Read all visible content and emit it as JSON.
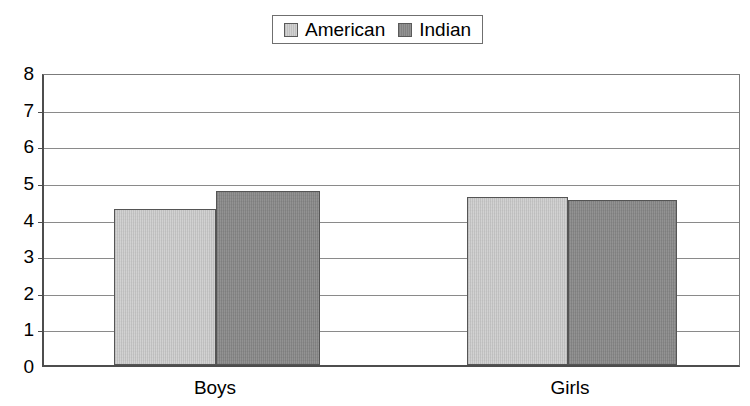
{
  "chart_data": {
    "type": "bar",
    "title": "",
    "subtitle": "",
    "xlabel": "",
    "ylabel": "",
    "categories": [
      "Boys",
      "Girls"
    ],
    "series": [
      {
        "name": "American",
        "values": [
          4.25,
          4.6
        ],
        "color": "#d2d2d2"
      },
      {
        "name": "Indian",
        "values": [
          4.75,
          4.5
        ],
        "color": "#939393"
      }
    ],
    "ylim": [
      0,
      8
    ],
    "ytick_step": 1,
    "ytick_labels": [
      "8",
      "7",
      "6",
      "5",
      "4",
      "3",
      "2",
      "1",
      "0"
    ],
    "grid": true,
    "grid_axis": "y",
    "legend_position": "top-center",
    "annotations": []
  },
  "legend": {
    "entries": [
      {
        "label": "American",
        "swatch": "light-gray-swatch-icon"
      },
      {
        "label": "Indian",
        "swatch": "dark-gray-swatch-icon"
      }
    ]
  },
  "axis": {
    "y_ticks": [
      "8",
      "7",
      "6",
      "5",
      "4",
      "3",
      "2",
      "1",
      "0"
    ],
    "x_ticks": [
      "Boys",
      "Girls"
    ]
  },
  "colors": {
    "series_american": "#d2d2d2",
    "series_indian": "#939393",
    "axis": "#4d4d4d",
    "gridline": "#8a8a8a",
    "bar_border": "#555555",
    "background": "#ffffff"
  }
}
